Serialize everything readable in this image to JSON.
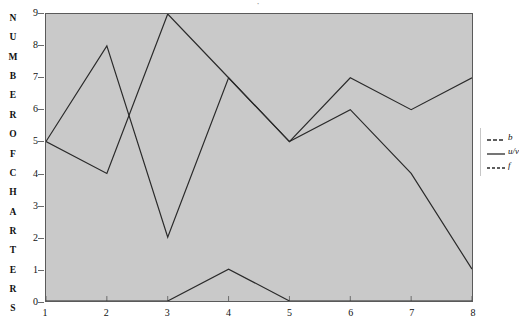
{
  "title_sliver": "·",
  "axis": {
    "y_caption_letters": [
      "N",
      "U",
      "M",
      "B",
      "E",
      "R",
      "O",
      "F",
      "C",
      "H",
      "A",
      "R",
      "T",
      "E",
      "R",
      "S"
    ],
    "y_caption_text": "NUMBER OF CHARTERS",
    "y_ticks": [
      "9",
      "8",
      "7",
      "6",
      "5",
      "4",
      "3",
      "2",
      "1",
      "0"
    ],
    "x_ticks": [
      "1",
      "2",
      "3",
      "4",
      "5",
      "6",
      "7",
      "8"
    ]
  },
  "legend": {
    "position": "right",
    "items": [
      {
        "label": "b",
        "dash": "4,2",
        "color": "#2a2a2a"
      },
      {
        "label": "u/v",
        "dash": "none",
        "color": "#2a2a2a"
      },
      {
        "label": "f",
        "dash": "3,2",
        "color": "#2a2a2a"
      }
    ]
  },
  "style": {
    "plot_background": "#c9c9c9",
    "plot_border": "#5a5a5a",
    "line_color": "#2a2a2a",
    "page_background": "#ffffff",
    "text_color": "#111111"
  },
  "chart_data": {
    "type": "line",
    "title": "",
    "xlabel": "",
    "ylabel": "NUMBER OF CHARTERS",
    "x": [
      1,
      2,
      3,
      4,
      5,
      6,
      7,
      8
    ],
    "xlim": [
      1,
      8
    ],
    "ylim": [
      0,
      9
    ],
    "grid": false,
    "legend_position": "right",
    "series": [
      {
        "name": "b",
        "values": [
          5,
          8,
          2,
          7,
          5,
          6,
          4,
          1
        ],
        "color": "#2a2a2a"
      },
      {
        "name": "u/v",
        "values": [
          5,
          4,
          9,
          7,
          5,
          7,
          6,
          7
        ],
        "color": "#2a2a2a"
      },
      {
        "name": "f",
        "values": [
          0,
          0,
          0,
          1,
          0,
          0,
          0,
          0
        ],
        "color": "#2a2a2a"
      }
    ]
  }
}
